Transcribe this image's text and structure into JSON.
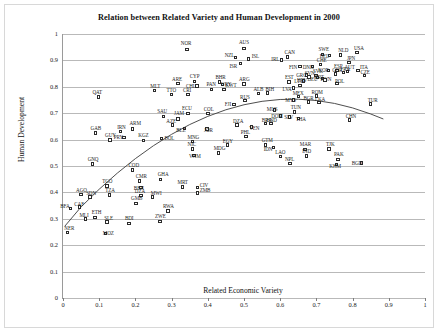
{
  "chart_data": {
    "type": "scatter",
    "title": "Relation between Related Variety and Human Development in 2000",
    "xlabel": "Related Economic Variety",
    "ylabel": "Human Development",
    "xlim": [
      0,
      1
    ],
    "ylim": [
      0,
      1
    ],
    "xticks": [
      "0",
      "0.1",
      "0.2",
      "0.3",
      "0.4",
      "0.5",
      "0.6",
      "0.7",
      "0.8",
      "0.9",
      "1"
    ],
    "yticks": [
      "0",
      "0.1",
      "0.2",
      "0.3",
      "0.4",
      "0.5",
      "0.6",
      "0.7",
      "0.8",
      "0.9",
      "1"
    ],
    "grid": "horizontal",
    "legend": "none",
    "marker": "open-square",
    "marker_color": "#2b2b2b",
    "trend_color": "#3a3a3a",
    "trendline": {
      "type": "quadratic-fit",
      "points": [
        [
          0.005,
          0.272
        ],
        [
          0.05,
          0.345
        ],
        [
          0.1,
          0.412
        ],
        [
          0.15,
          0.473
        ],
        [
          0.2,
          0.528
        ],
        [
          0.25,
          0.577
        ],
        [
          0.3,
          0.62
        ],
        [
          0.35,
          0.657
        ],
        [
          0.4,
          0.688
        ],
        [
          0.45,
          0.713
        ],
        [
          0.5,
          0.732
        ],
        [
          0.55,
          0.745
        ],
        [
          0.6,
          0.752
        ],
        [
          0.65,
          0.753
        ],
        [
          0.7,
          0.748
        ],
        [
          0.75,
          0.737
        ],
        [
          0.8,
          0.72
        ],
        [
          0.85,
          0.697
        ],
        [
          0.885,
          0.678
        ]
      ]
    },
    "points": [
      {
        "label": "NOR",
        "x": 0.342,
        "y": 0.942,
        "lx": -6,
        "ly": -8
      },
      {
        "label": "AUS",
        "x": 0.5,
        "y": 0.946,
        "lx": -5,
        "ly": -8
      },
      {
        "label": "NZL",
        "x": 0.477,
        "y": 0.912,
        "lx": -11,
        "ly": -4
      },
      {
        "label": "ISL",
        "x": 0.513,
        "y": 0.906,
        "lx": 3,
        "ly": -5
      },
      {
        "label": "CAN",
        "x": 0.62,
        "y": 0.913,
        "lx": -3,
        "ly": -7
      },
      {
        "label": "IRL",
        "x": 0.603,
        "y": 0.902,
        "lx": -10,
        "ly": -3
      },
      {
        "label": "ISR",
        "x": 0.49,
        "y": 0.888,
        "lx": -11,
        "ly": 0
      },
      {
        "label": "SWE",
        "x": 0.717,
        "y": 0.923,
        "lx": -4,
        "ly": -7
      },
      {
        "label": "BEL",
        "x": 0.737,
        "y": 0.918,
        "lx": -10,
        "ly": -2
      },
      {
        "label": "NLD",
        "x": 0.766,
        "y": 0.92,
        "lx": -2,
        "ly": -7
      },
      {
        "label": "USA",
        "x": 0.812,
        "y": 0.929,
        "lx": -3,
        "ly": -7
      },
      {
        "label": "FIN",
        "x": 0.655,
        "y": 0.878,
        "lx": -11,
        "ly": -1
      },
      {
        "label": "DNK",
        "x": 0.69,
        "y": 0.876,
        "lx": -10,
        "ly": -2
      },
      {
        "label": "CHE",
        "x": 0.712,
        "y": 0.885,
        "lx": -4,
        "ly": -6
      },
      {
        "label": "JPN",
        "x": 0.79,
        "y": 0.893,
        "lx": -2,
        "ly": -6
      },
      {
        "label": "KOR",
        "x": 0.733,
        "y": 0.862,
        "lx": -10,
        "ly": -2
      },
      {
        "label": "ESP",
        "x": 0.757,
        "y": 0.862,
        "lx": -3,
        "ly": -6
      },
      {
        "label": "AUT",
        "x": 0.786,
        "y": 0.858,
        "lx": -3,
        "ly": -6
      },
      {
        "label": "ITA",
        "x": 0.815,
        "y": 0.862,
        "lx": 2,
        "ly": -5
      },
      {
        "label": "GRC",
        "x": 0.672,
        "y": 0.845,
        "lx": -10,
        "ly": -2
      },
      {
        "label": "SVK",
        "x": 0.699,
        "y": 0.843,
        "lx": -3,
        "ly": -6
      },
      {
        "label": "GBR",
        "x": 0.752,
        "y": 0.848,
        "lx": -3,
        "ly": -6
      },
      {
        "label": "FRA",
        "x": 0.775,
        "y": 0.854,
        "lx": -3,
        "ly": -6
      },
      {
        "label": "CZE",
        "x": 0.833,
        "y": 0.842,
        "lx": -4,
        "ly": -6
      },
      {
        "label": "DEU",
        "x": 0.703,
        "y": 0.835,
        "lx": -10,
        "ly": -1
      },
      {
        "label": "HUN",
        "x": 0.717,
        "y": 0.832,
        "lx": -2,
        "ly": -1
      },
      {
        "label": "PRT",
        "x": 0.724,
        "y": 0.826,
        "lx": -10,
        "ly": -5
      },
      {
        "label": "SVN",
        "x": 0.679,
        "y": 0.837,
        "lx": -4,
        "ly": -6
      },
      {
        "label": "LTU",
        "x": 0.664,
        "y": 0.822,
        "lx": -9,
        "ly": -2
      },
      {
        "label": "POL",
        "x": 0.757,
        "y": 0.812,
        "lx": -2,
        "ly": -5
      },
      {
        "label": "MLT",
        "x": 0.252,
        "y": 0.785,
        "lx": -4,
        "ly": -7
      },
      {
        "label": "QAT",
        "x": 0.098,
        "y": 0.762,
        "lx": -6,
        "ly": -7
      },
      {
        "label": "ARE",
        "x": 0.318,
        "y": 0.812,
        "lx": -6,
        "ly": -7
      },
      {
        "label": "CYP",
        "x": 0.364,
        "y": 0.82,
        "lx": -5,
        "ly": -8
      },
      {
        "label": "CHL",
        "x": 0.37,
        "y": 0.803,
        "lx": -11,
        "ly": -2
      },
      {
        "label": "BHR",
        "x": 0.432,
        "y": 0.818,
        "lx": -4,
        "ly": -7
      },
      {
        "label": "KWT",
        "x": 0.44,
        "y": 0.808,
        "lx": 3,
        "ly": -2
      },
      {
        "label": "ARG",
        "x": 0.5,
        "y": 0.81,
        "lx": -5,
        "ly": -7
      },
      {
        "label": "EST",
        "x": 0.624,
        "y": 0.818,
        "lx": -4,
        "ly": -7
      },
      {
        "label": "HRV",
        "x": 0.655,
        "y": 0.806,
        "lx": -3,
        "ly": -7
      },
      {
        "label": "LVA",
        "x": 0.637,
        "y": 0.795,
        "lx": -11,
        "ly": -1
      },
      {
        "label": "PAN",
        "x": 0.41,
        "y": 0.79,
        "lx": -5,
        "ly": -7
      },
      {
        "label": "URY",
        "x": 0.445,
        "y": 0.79,
        "lx": -3,
        "ly": -7
      },
      {
        "label": "ALB",
        "x": 0.54,
        "y": 0.775,
        "lx": -5,
        "ly": -6
      },
      {
        "label": "BIH",
        "x": 0.565,
        "y": 0.776,
        "lx": -2,
        "ly": -6
      },
      {
        "label": "TTO",
        "x": 0.3,
        "y": 0.77,
        "lx": -5,
        "ly": -7
      },
      {
        "label": "CRI",
        "x": 0.345,
        "y": 0.77,
        "lx": -5,
        "ly": -7
      },
      {
        "label": "MEX",
        "x": 0.651,
        "y": 0.763,
        "lx": -6,
        "ly": -6
      },
      {
        "label": "ROM",
        "x": 0.7,
        "y": 0.765,
        "lx": -5,
        "ly": -6
      },
      {
        "label": "MYS",
        "x": 0.636,
        "y": 0.75,
        "lx": -8,
        "ly": -2
      },
      {
        "label": "BGR",
        "x": 0.678,
        "y": 0.742,
        "lx": -5,
        "ly": -6
      },
      {
        "label": "LKA",
        "x": 0.707,
        "y": 0.74,
        "lx": -4,
        "ly": -6
      },
      {
        "label": "SAU",
        "x": 0.277,
        "y": 0.688,
        "lx": -6,
        "ly": -7
      },
      {
        "label": "JAM",
        "x": 0.318,
        "y": 0.678,
        "lx": -4,
        "ly": -8
      },
      {
        "label": "FJI",
        "x": 0.472,
        "y": 0.733,
        "lx": -9,
        "ly": -2
      },
      {
        "label": "RUS",
        "x": 0.503,
        "y": 0.748,
        "lx": -5,
        "ly": -6
      },
      {
        "label": "TUR",
        "x": 0.85,
        "y": 0.735,
        "lx": -3,
        "ly": -6
      },
      {
        "label": "MUS",
        "x": 0.585,
        "y": 0.712,
        "lx": -8,
        "ly": -3
      },
      {
        "label": "TUN",
        "x": 0.64,
        "y": 0.705,
        "lx": -4,
        "ly": -7
      },
      {
        "label": "DOM",
        "x": 0.6,
        "y": 0.69,
        "lx": -9,
        "ly": -2
      },
      {
        "label": "SLV",
        "x": 0.625,
        "y": 0.685,
        "lx": -5,
        "ly": -2
      },
      {
        "label": "THA",
        "x": 0.651,
        "y": 0.68,
        "lx": -3,
        "ly": -1
      },
      {
        "label": "CHN",
        "x": 0.792,
        "y": 0.675,
        "lx": -4,
        "ly": -6
      },
      {
        "label": "HND",
        "x": 0.575,
        "y": 0.66,
        "lx": -5,
        "ly": -6
      },
      {
        "label": "GAB",
        "x": 0.09,
        "y": 0.625,
        "lx": -5,
        "ly": -7
      },
      {
        "label": "IRN",
        "x": 0.158,
        "y": 0.63,
        "lx": -3,
        "ly": -7
      },
      {
        "label": "ARM",
        "x": 0.192,
        "y": 0.64,
        "lx": -3,
        "ly": -8
      },
      {
        "label": "PRY",
        "x": 0.168,
        "y": 0.608,
        "lx": -10,
        "ly": -2
      },
      {
        "label": "GUY",
        "x": 0.13,
        "y": 0.598,
        "lx": -5,
        "ly": -7
      },
      {
        "label": "KGZ",
        "x": 0.222,
        "y": 0.597,
        "lx": -5,
        "ly": -7
      },
      {
        "label": "BOL",
        "x": 0.272,
        "y": 0.605,
        "lx": 3,
        "ly": -2
      },
      {
        "label": "ECU",
        "x": 0.345,
        "y": 0.7,
        "lx": -6,
        "ly": -7
      },
      {
        "label": "COL",
        "x": 0.4,
        "y": 0.698,
        "lx": -4,
        "ly": -7
      },
      {
        "label": "AZE",
        "x": 0.302,
        "y": 0.655,
        "lx": -6,
        "ly": -6
      },
      {
        "label": "BLZ",
        "x": 0.335,
        "y": 0.642,
        "lx": -8,
        "ly": -1
      },
      {
        "label": "JOR",
        "x": 0.398,
        "y": 0.64,
        "lx": -3,
        "ly": -1
      },
      {
        "label": "DZA",
        "x": 0.481,
        "y": 0.655,
        "lx": -4,
        "ly": -6
      },
      {
        "label": "VEN",
        "x": 0.52,
        "y": 0.648,
        "lx": -2,
        "ly": -1
      },
      {
        "label": "BRA",
        "x": 0.56,
        "y": 0.66,
        "lx": -4,
        "ly": -6
      },
      {
        "label": "PHL",
        "x": 0.505,
        "y": 0.612,
        "lx": -5,
        "ly": -6
      },
      {
        "label": "EGY",
        "x": 0.455,
        "y": 0.58,
        "lx": -5,
        "ly": -6
      },
      {
        "label": "GTM",
        "x": 0.56,
        "y": 0.58,
        "lx": -4,
        "ly": -7
      },
      {
        "label": "IDN",
        "x": 0.582,
        "y": 0.57,
        "lx": -10,
        "ly": -1
      },
      {
        "label": "MNG",
        "x": 0.358,
        "y": 0.592,
        "lx": -5,
        "ly": -7
      },
      {
        "label": "NIC",
        "x": 0.358,
        "y": 0.565,
        "lx": -5,
        "ly": -7
      },
      {
        "label": "VNM",
        "x": 0.362,
        "y": 0.54,
        "lx": -5,
        "ly": -1
      },
      {
        "label": "MDG",
        "x": 0.43,
        "y": 0.55,
        "lx": -5,
        "ly": -7
      },
      {
        "label": "MAR",
        "x": 0.668,
        "y": 0.563,
        "lx": -5,
        "ly": -7
      },
      {
        "label": "TJK",
        "x": 0.735,
        "y": 0.565,
        "lx": -3,
        "ly": -7
      },
      {
        "label": "LAO",
        "x": 0.6,
        "y": 0.535,
        "lx": -5,
        "ly": -7
      },
      {
        "label": "IND",
        "x": 0.672,
        "y": 0.538,
        "lx": -4,
        "ly": -7
      },
      {
        "label": "PAK",
        "x": 0.76,
        "y": 0.525,
        "lx": -4,
        "ly": -7
      },
      {
        "label": "NPL",
        "x": 0.627,
        "y": 0.51,
        "lx": -5,
        "ly": -6
      },
      {
        "label": "KHM",
        "x": 0.755,
        "y": 0.505,
        "lx": -7,
        "ly": -1
      },
      {
        "label": "BGD",
        "x": 0.825,
        "y": 0.512,
        "lx": -10,
        "ly": -2
      },
      {
        "label": "GNQ",
        "x": 0.082,
        "y": 0.508,
        "lx": -5,
        "ly": -7
      },
      {
        "label": "COD",
        "x": 0.192,
        "y": 0.485,
        "lx": -4,
        "ly": -7
      },
      {
        "label": "TGO",
        "x": 0.122,
        "y": 0.425,
        "lx": -5,
        "ly": -7
      },
      {
        "label": "CMR",
        "x": 0.212,
        "y": 0.443,
        "lx": -4,
        "ly": -7
      },
      {
        "label": "GHA",
        "x": 0.27,
        "y": 0.45,
        "lx": -3,
        "ly": -7
      },
      {
        "label": "BEN",
        "x": 0.215,
        "y": 0.418,
        "lx": -7,
        "ly": -2
      },
      {
        "label": "MRT",
        "x": 0.33,
        "y": 0.42,
        "lx": -5,
        "ly": -7
      },
      {
        "label": "CIV",
        "x": 0.372,
        "y": 0.418,
        "lx": 2,
        "ly": -5
      },
      {
        "label": "ZMB",
        "x": 0.372,
        "y": 0.398,
        "lx": 2,
        "ly": -5
      },
      {
        "label": "AGO",
        "x": 0.05,
        "y": 0.392,
        "lx": -5,
        "ly": -7
      },
      {
        "label": "SDN",
        "x": 0.075,
        "y": 0.383,
        "lx": -4,
        "ly": -6
      },
      {
        "label": "TZA",
        "x": 0.128,
        "y": 0.39,
        "lx": -4,
        "ly": -7
      },
      {
        "label": "DZA2",
        "x": 0.215,
        "y": 0.388,
        "lx": -6,
        "ly": -7
      },
      {
        "label": "MWI",
        "x": 0.248,
        "y": 0.383,
        "lx": -2,
        "ly": -6
      },
      {
        "label": "GMB",
        "x": 0.202,
        "y": 0.358,
        "lx": -5,
        "ly": -7
      },
      {
        "label": "CAF",
        "x": 0.045,
        "y": 0.345,
        "lx": -5,
        "ly": -5
      },
      {
        "label": "BFA",
        "x": 0.02,
        "y": 0.34,
        "lx": -10,
        "ly": -4
      },
      {
        "label": "RWA",
        "x": 0.29,
        "y": 0.33,
        "lx": -5,
        "ly": -7
      },
      {
        "label": "MLI",
        "x": 0.062,
        "y": 0.3,
        "lx": -6,
        "ly": -6
      },
      {
        "label": "ETH",
        "x": 0.088,
        "y": 0.305,
        "lx": -3,
        "ly": -7
      },
      {
        "label": "SLE",
        "x": 0.122,
        "y": 0.288,
        "lx": -3,
        "ly": -6
      },
      {
        "label": "BDI",
        "x": 0.182,
        "y": 0.283,
        "lx": -4,
        "ly": -7
      },
      {
        "label": "ZWE",
        "x": 0.268,
        "y": 0.29,
        "lx": -5,
        "ly": -7
      },
      {
        "label": "NER",
        "x": 0.012,
        "y": 0.247,
        "lx": -3,
        "ly": -7
      },
      {
        "label": "MOZ",
        "x": 0.118,
        "y": 0.245,
        "lx": -3,
        "ly": -2
      }
    ]
  }
}
